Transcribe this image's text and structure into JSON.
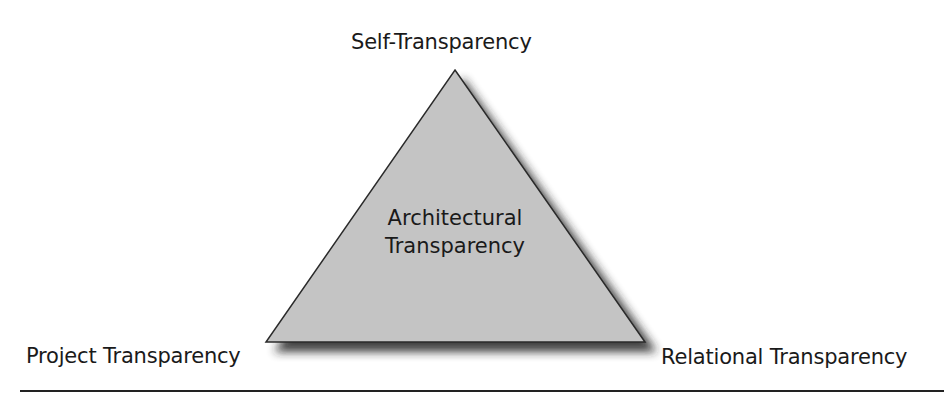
{
  "diagram": {
    "type": "triangle",
    "center_label_line1": "Architectural",
    "center_label_line2": "Transparency",
    "vertices": {
      "top": "Self-Transparency",
      "bottom_left": "Project Transparency",
      "bottom_right": "Relational Transparency"
    },
    "colors": {
      "fill": "#c4c4c4",
      "stroke": "#2a2a2a",
      "shadow": "#333333",
      "rule": "#222222"
    }
  }
}
